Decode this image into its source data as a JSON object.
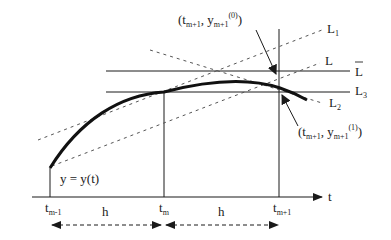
{
  "diagram": {
    "type": "numerical-method-step-illustration",
    "axis": {
      "label": "t"
    },
    "curve": {
      "label": "y = y(t)"
    },
    "ticks": [
      {
        "id": "tm-1",
        "base": "t",
        "sub": "m-1"
      },
      {
        "id": "tm",
        "base": "t",
        "sub": "m"
      },
      {
        "id": "tm+1",
        "base": "t",
        "sub": "m+1"
      }
    ],
    "steps": [
      {
        "label": "h"
      },
      {
        "label": "h"
      }
    ],
    "lines": {
      "L1": {
        "base": "L",
        "sub": "1",
        "style": "dashed"
      },
      "L": {
        "base": "L",
        "sub": "",
        "style": "dashed"
      },
      "Lbar": {
        "base": "L",
        "sub": "",
        "overline": true,
        "style": "solid"
      },
      "L3": {
        "base": "L",
        "sub": "3",
        "style": "solid"
      },
      "L2": {
        "base": "L",
        "sub": "2",
        "style": "dashed"
      }
    },
    "points": {
      "predictor": {
        "open": "(",
        "t": "t",
        "t_sub": "m+1",
        "sep": ", ",
        "y": "y",
        "y_sub": "m+1",
        "y_sup": "(0)",
        "close": ")"
      },
      "corrector": {
        "open": "(",
        "t": "t",
        "t_sub": "m+1",
        "sep": ", ",
        "y": "y",
        "y_sub": "m+1",
        "y_sup": "(1)",
        "close": ")"
      }
    },
    "colors": {
      "ink": "#1a1a1a",
      "dashed": "#555555",
      "background": "#ffffff"
    }
  }
}
